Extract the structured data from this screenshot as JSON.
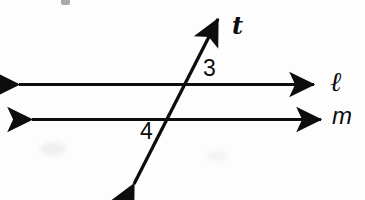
{
  "figure": {
    "width": 365,
    "height": 200,
    "background_color": "#fdfdfd",
    "stroke_color": "#0d0d0d",
    "stroke_width": 3
  },
  "lines": {
    "line_l": {
      "name": "l",
      "label": "ℓ",
      "label_style": "script-italic",
      "orientation": "horizontal",
      "y": 84,
      "x_start": 15,
      "x_end": 318,
      "arrowheads": "both",
      "label_x": 335,
      "label_y": 84
    },
    "line_m": {
      "name": "m",
      "label": "m",
      "label_style": "italic",
      "orientation": "horizontal",
      "y": 119,
      "x_start": 28,
      "x_end": 325,
      "arrowheads": "both",
      "label_x": 340,
      "label_y": 119
    },
    "transversal_t": {
      "name": "t",
      "label": "t",
      "label_style": "serif-italic-bold",
      "orientation": "diagonal",
      "x_start": 130,
      "y_start": 192,
      "x_end": 222,
      "y_end": 12,
      "arrowheads": "both",
      "label_x": 238,
      "label_y": 26
    }
  },
  "intersections": [
    {
      "lines": "t-and-l",
      "x": 188,
      "y": 85
    },
    {
      "lines": "t-and-m",
      "x": 170,
      "y": 119
    }
  ],
  "angles": [
    {
      "label": "3",
      "at_intersection": "t-and-l",
      "position": "upper-right",
      "x": 208,
      "y": 70
    },
    {
      "label": "4",
      "at_intersection": "t-and-m",
      "position": "lower-left",
      "x": 147,
      "y": 133
    }
  ],
  "artifacts": {
    "top_speck": "scan-speck",
    "lower_left_smudge": "scan-smudge",
    "mid_right_smudge": "scan-smudge"
  }
}
